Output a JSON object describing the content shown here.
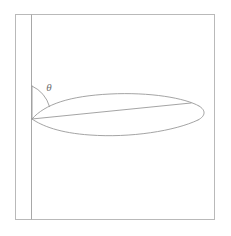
{
  "figure": {
    "kind": "airfoil-angle-of-attack-diagram",
    "background_color": "#ffffff",
    "line_color": "#9a9a9a",
    "frame_color": "#b9b9b9",
    "label_color": "#6f6f6f",
    "angle_label": "θ",
    "angle_label_name": "theta-symbol",
    "frame": {
      "x": 15,
      "y": 14,
      "width": 200,
      "height": 206
    },
    "wall_line": {
      "x": 31,
      "y_top": 14,
      "y_bottom": 220
    },
    "leading_edge": {
      "x": 32,
      "y": 119
    },
    "trailing_edge": {
      "x": 206,
      "y": 112
    },
    "chord": {
      "start_x": 32,
      "start_y": 119,
      "end_x": 191,
      "end_y": 103
    },
    "reference_vertical": {
      "x": 32,
      "y_top": 86,
      "y_bottom": 119
    },
    "arc": {
      "center_x": 32,
      "center_y": 119,
      "radius": 33,
      "start_x": 32,
      "start_y": 86,
      "end_x": 49,
      "end_y": 106
    },
    "angle_label_position": {
      "x": 49,
      "y": 87
    },
    "airfoil_upper_path": "M 32 119 C 45 104, 70 96, 110 94 C 150 92, 185 98, 199 106",
    "airfoil_tip_path": "M 199 106 C 206 110, 206 116, 198 120",
    "airfoil_lower_path": "M 198 120 C 175 131, 130 138, 90 135 C 60 133, 42 126, 32 119"
  }
}
